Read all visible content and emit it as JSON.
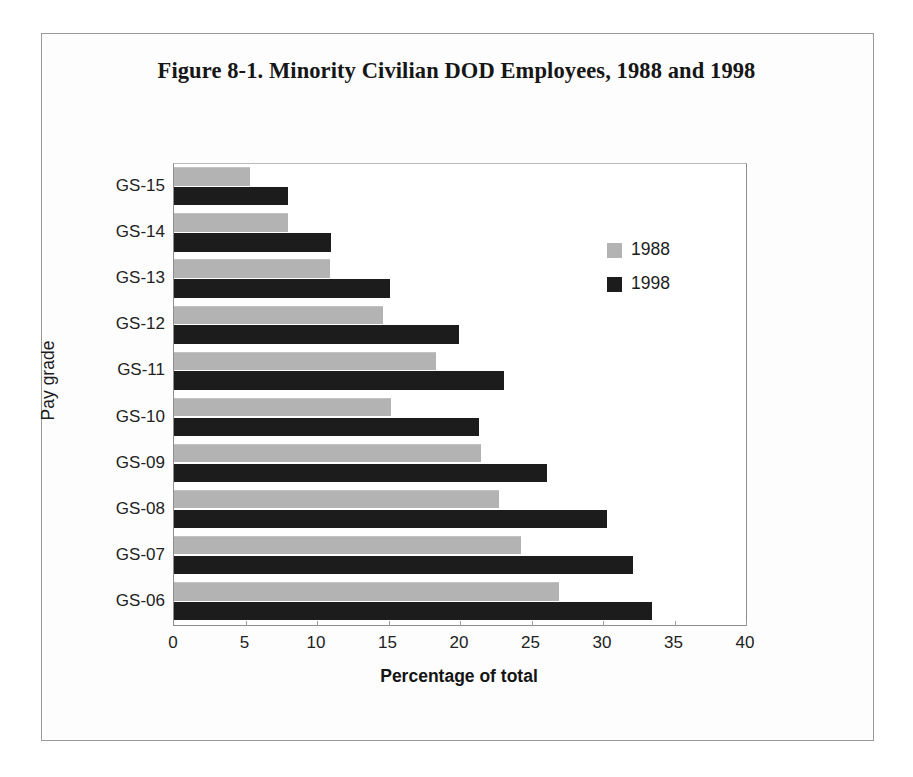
{
  "figure": {
    "title": "Figure  8-1. Minority Civilian DOD Employees, 1988 and 1998"
  },
  "legend": {
    "position": "inside-right",
    "entries": [
      {
        "label": "1988",
        "color": "#b3b3b3",
        "swatch_name": "legend-swatch-1988"
      },
      {
        "label": "1998",
        "color": "#1c1c1c",
        "swatch_name": "legend-swatch-1998"
      }
    ]
  },
  "colors": {
    "series_1988": "#b3b3b3",
    "series_1998": "#1c1c1c",
    "axis": "#8e8e8e",
    "frame": "#9a9a9a",
    "page": "#ffffff",
    "text": "#1a1a1a"
  },
  "chart_data": {
    "type": "bar",
    "orientation": "horizontal",
    "title": "Figure  8-1. Minority Civilian DOD Employees, 1988 and 1998",
    "xlabel": "Percentage of total",
    "ylabel": "Pay grade",
    "xlim": [
      0,
      40
    ],
    "xticks": [
      0,
      5,
      10,
      15,
      20,
      25,
      30,
      35,
      40
    ],
    "xtick_labels": [
      "0",
      "5",
      "10",
      "15",
      "20",
      "25",
      "30",
      "35",
      "40"
    ],
    "grid": false,
    "legend_position": "inside-right",
    "categories": [
      "GS-15",
      "GS-14",
      "GS-13",
      "GS-12",
      "GS-11",
      "GS-10",
      "GS-09",
      "GS-08",
      "GS-07",
      "GS-06"
    ],
    "series": [
      {
        "name": "1988",
        "color": "#b3b3b3",
        "values": [
          5.3,
          8.0,
          10.9,
          14.6,
          18.3,
          15.2,
          21.5,
          22.7,
          24.3,
          26.9
        ]
      },
      {
        "name": "1998",
        "color": "#1c1c1c",
        "values": [
          8.0,
          11.0,
          15.1,
          19.9,
          23.1,
          21.3,
          26.1,
          30.3,
          32.1,
          33.4
        ]
      }
    ]
  }
}
